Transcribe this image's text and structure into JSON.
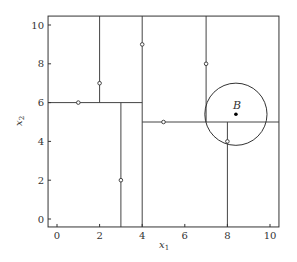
{
  "chart_data": {
    "type": "scatter",
    "title": "",
    "xlabel": "x1",
    "ylabel": "x2",
    "xlim": [
      -0.42,
      10.42
    ],
    "ylim": [
      -0.41,
      10.46
    ],
    "xticks": [
      0,
      2,
      4,
      6,
      8,
      10
    ],
    "yticks": [
      0,
      2,
      4,
      6,
      8,
      10
    ],
    "grid": false,
    "legend": null,
    "points": [
      {
        "x": 1,
        "y": 6
      },
      {
        "x": 2,
        "y": 7
      },
      {
        "x": 3,
        "y": 2
      },
      {
        "x": 4,
        "y": 9
      },
      {
        "x": 5,
        "y": 5
      },
      {
        "x": 7,
        "y": 8
      },
      {
        "x": 8,
        "y": 4
      }
    ],
    "query_point": {
      "label": "B",
      "x": 8.4,
      "y": 5.4
    },
    "query_circle": {
      "cx": 8.4,
      "cy": 5.4,
      "r": 1.46
    },
    "splits": [
      {
        "orientation": "vertical",
        "at": 4,
        "from": -0.41,
        "to": 10.46
      },
      {
        "orientation": "horizontal",
        "at": 6,
        "from": -0.42,
        "to": 4
      },
      {
        "orientation": "vertical",
        "at": 2,
        "from": 6,
        "to": 10.46
      },
      {
        "orientation": "vertical",
        "at": 3,
        "from": -0.41,
        "to": 6
      },
      {
        "orientation": "horizontal",
        "at": 5,
        "from": 4,
        "to": 10.42
      },
      {
        "orientation": "vertical",
        "at": 7,
        "from": 5,
        "to": 10.46
      },
      {
        "orientation": "vertical",
        "at": 8,
        "from": -0.41,
        "to": 5
      }
    ],
    "annotations": [
      "B"
    ]
  },
  "labels": {
    "xlabel_main": "x",
    "xlabel_sub": "1",
    "ylabel_main": "x",
    "ylabel_sub": "2",
    "query_label": "B"
  }
}
